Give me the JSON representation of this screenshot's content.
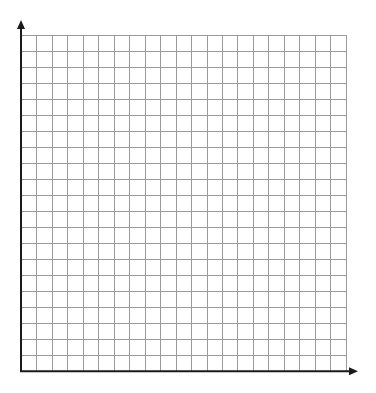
{
  "figure": {
    "type": "blank-coordinate-grid",
    "columns": 21,
    "rows": 21,
    "colors": {
      "background": "#ffffff",
      "grid": "#9a9a9a",
      "axis": "#1a1a1a"
    },
    "grid_box": {
      "left": 21,
      "top": 35.3,
      "right": 345.7,
      "bottom": 371.3
    },
    "x_axis": {
      "start": 20,
      "end": 358,
      "y": 371.3,
      "arrow": "right"
    },
    "y_axis": {
      "start": 372,
      "end": 20,
      "x": 21,
      "arrow": "up"
    }
  }
}
